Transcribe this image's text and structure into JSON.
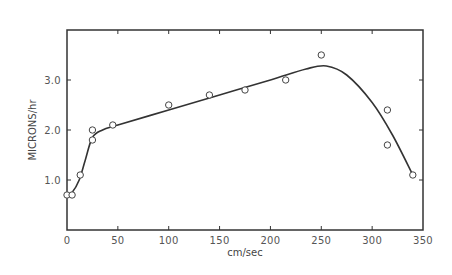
{
  "chart_data": {
    "type": "scatter",
    "title": "",
    "xlabel": "cm/sec",
    "ylabel": "MICRONS/hr",
    "xlim": [
      0,
      350
    ],
    "ylim": [
      0,
      4.0
    ],
    "grid": false,
    "legend": null,
    "x_ticks": [
      0,
      50,
      100,
      150,
      200,
      250,
      300,
      350
    ],
    "x_tick_labels": [
      "0",
      "50",
      "100",
      "150",
      "200",
      "250",
      "300",
      "350"
    ],
    "y_ticks": [
      1.0,
      2.0,
      3.0
    ],
    "y_tick_labels": [
      "1.0",
      "2.0",
      "3.0"
    ],
    "series": [
      {
        "name": "measured",
        "marker": "open-circle",
        "points": [
          {
            "x": 0,
            "y": 0.7
          },
          {
            "x": 5,
            "y": 0.7
          },
          {
            "x": 13,
            "y": 1.1
          },
          {
            "x": 25,
            "y": 2.0
          },
          {
            "x": 25,
            "y": 1.8
          },
          {
            "x": 45,
            "y": 2.1
          },
          {
            "x": 100,
            "y": 2.5
          },
          {
            "x": 140,
            "y": 2.7
          },
          {
            "x": 175,
            "y": 2.8
          },
          {
            "x": 215,
            "y": 3.0
          },
          {
            "x": 250,
            "y": 3.5
          },
          {
            "x": 315,
            "y": 2.4
          },
          {
            "x": 315,
            "y": 1.7
          },
          {
            "x": 340,
            "y": 1.1
          }
        ]
      },
      {
        "name": "fitted-curve",
        "marker": "line",
        "points": [
          {
            "x": 0,
            "y": 0.7
          },
          {
            "x": 5,
            "y": 0.75
          },
          {
            "x": 12,
            "y": 1.0
          },
          {
            "x": 18,
            "y": 1.4
          },
          {
            "x": 25,
            "y": 1.85
          },
          {
            "x": 35,
            "y": 2.0
          },
          {
            "x": 50,
            "y": 2.1
          },
          {
            "x": 100,
            "y": 2.4
          },
          {
            "x": 150,
            "y": 2.7
          },
          {
            "x": 200,
            "y": 3.0
          },
          {
            "x": 235,
            "y": 3.22
          },
          {
            "x": 255,
            "y": 3.28
          },
          {
            "x": 275,
            "y": 3.1
          },
          {
            "x": 300,
            "y": 2.55
          },
          {
            "x": 320,
            "y": 1.9
          },
          {
            "x": 340,
            "y": 1.1
          }
        ]
      }
    ]
  }
}
